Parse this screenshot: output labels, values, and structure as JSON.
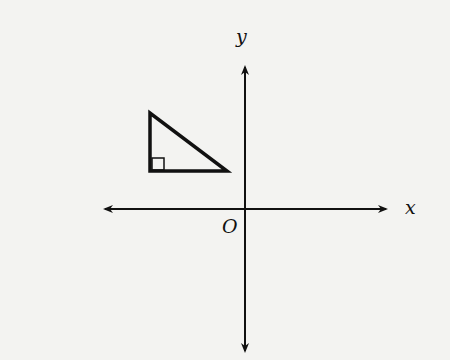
{
  "diagram": {
    "axes": {
      "x_label": "x",
      "y_label": "y",
      "origin_label": "O"
    },
    "shape": {
      "type": "right-triangle",
      "quadrant": "II",
      "right_angle_marker": true,
      "vertices_px": [
        [
          150,
          111
        ],
        [
          150,
          171
        ],
        [
          229,
          171
        ]
      ]
    },
    "colors": {
      "stroke": "#111111",
      "background": "#f3f3f1"
    }
  }
}
